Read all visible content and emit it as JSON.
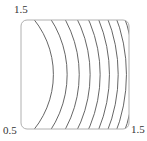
{
  "chart_data": {
    "type": "contour",
    "title": "",
    "xlabel": "",
    "ylabel": "",
    "xlim": [
      0.5,
      1.5
    ],
    "ylim": [
      0.5,
      1.5
    ],
    "function": "x^2 + y^2",
    "levels": [
      0.64,
      0.86,
      1.08,
      1.3,
      1.52,
      1.74,
      1.96,
      2.18,
      2.4,
      2.62,
      2.84,
      3.06,
      3.28,
      3.5,
      3.72,
      3.94,
      4.16,
      4.38
    ],
    "grid": false,
    "legend": null,
    "tick_labels": {
      "y_max": "1.5",
      "origin": "0.5",
      "x_max": "1.5"
    },
    "colors": {
      "frame": "#b0b0b0",
      "contour": "#555555",
      "text": "#333333"
    }
  }
}
